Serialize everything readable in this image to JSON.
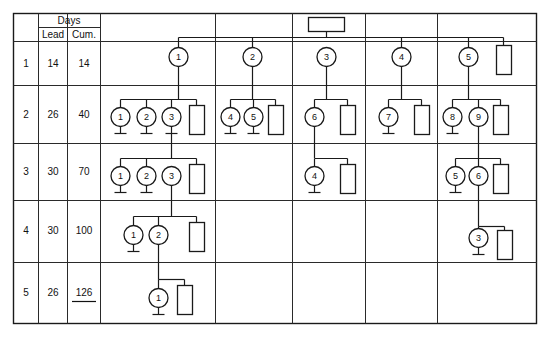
{
  "diagram": {
    "colors": {
      "line": "#1a1a1a",
      "grid": "#2a2a2a",
      "background": "#ffffff",
      "text": "#111111"
    },
    "table": {
      "header": {
        "level_col_label": "",
        "group_label": "Days",
        "sub_labels": [
          "Lead",
          "Cum."
        ]
      },
      "rows": [
        {
          "level": "1",
          "lead": "14",
          "cum": "14",
          "cum_underlined": false
        },
        {
          "level": "2",
          "lead": "26",
          "cum": "40",
          "cum_underlined": false
        },
        {
          "level": "3",
          "lead": "30",
          "cum": "70",
          "cum_underlined": false
        },
        {
          "level": "4",
          "lead": "30",
          "cum": "100",
          "cum_underlined": false
        },
        {
          "level": "5",
          "lead": "26",
          "cum": "126",
          "cum_underlined": true
        }
      ]
    },
    "columns": [
      {
        "name": "branch-a"
      },
      {
        "name": "branch-b"
      },
      {
        "name": "branch-c"
      },
      {
        "name": "branch-d"
      },
      {
        "name": "branch-e"
      }
    ],
    "top_box": {
      "label": "",
      "shape": "rectangle-horizontal",
      "column": "branch-c"
    },
    "nodes": {
      "level1": [
        {
          "id": "n1-a",
          "label": "1",
          "column": "branch-a"
        },
        {
          "id": "n1-b",
          "label": "2",
          "column": "branch-b"
        },
        {
          "id": "n1-c",
          "label": "3",
          "column": "branch-c"
        },
        {
          "id": "n1-d",
          "label": "4",
          "column": "branch-d"
        },
        {
          "id": "n1-e",
          "label": "5",
          "column": "branch-e"
        }
      ],
      "level2": [
        {
          "id": "n2-a1",
          "label": "1",
          "column": "branch-a"
        },
        {
          "id": "n2-a2",
          "label": "2",
          "column": "branch-a"
        },
        {
          "id": "n2-a3",
          "label": "3",
          "column": "branch-a"
        },
        {
          "id": "n2-b1",
          "label": "4",
          "column": "branch-b"
        },
        {
          "id": "n2-b2",
          "label": "5",
          "column": "branch-b"
        },
        {
          "id": "n2-c1",
          "label": "6",
          "column": "branch-c"
        },
        {
          "id": "n2-d1",
          "label": "7",
          "column": "branch-d"
        },
        {
          "id": "n2-e1",
          "label": "8",
          "column": "branch-e"
        },
        {
          "id": "n2-e2",
          "label": "9",
          "column": "branch-e"
        }
      ],
      "level3": [
        {
          "id": "n3-a1",
          "label": "1",
          "column": "branch-a"
        },
        {
          "id": "n3-a2",
          "label": "2",
          "column": "branch-a"
        },
        {
          "id": "n3-a3",
          "label": "3",
          "column": "branch-a"
        },
        {
          "id": "n3-c1",
          "label": "4",
          "column": "branch-c"
        },
        {
          "id": "n3-e1",
          "label": "5",
          "column": "branch-e"
        },
        {
          "id": "n3-e2",
          "label": "6",
          "column": "branch-e"
        }
      ],
      "level4": [
        {
          "id": "n4-a1",
          "label": "1",
          "column": "branch-a"
        },
        {
          "id": "n4-a2",
          "label": "2",
          "column": "branch-a"
        },
        {
          "id": "n4-e1",
          "label": "3",
          "column": "branch-e"
        }
      ],
      "level5": [
        {
          "id": "n5-a1",
          "label": "1",
          "column": "branch-a"
        }
      ]
    },
    "part_boxes": {
      "note": "vertical rectangles representing purchased parts",
      "counts_by_level": {
        "level1": 1,
        "level2": 5,
        "level3": 3,
        "level4": 2,
        "level5": 1
      }
    }
  }
}
